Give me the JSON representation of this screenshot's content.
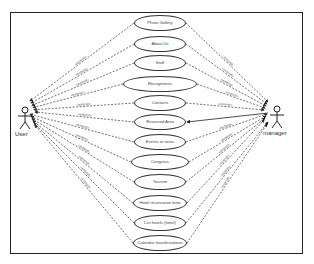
{
  "diagram": {
    "type": "use-case",
    "actors": [
      {
        "id": "user",
        "label": "User"
      },
      {
        "id": "manager",
        "label": "manager"
      }
    ],
    "use_cases": [
      {
        "label": "Photo Gallery",
        "cy": 23,
        "w": 52
      },
      {
        "label": "About Us",
        "cy": 44,
        "w": 52
      },
      {
        "label": "Staff",
        "cy": 63,
        "w": 52
      },
      {
        "label": "Recognitions",
        "cy": 84,
        "w": 74
      },
      {
        "label": "Contacts",
        "cy": 103,
        "w": 52
      },
      {
        "label": "Reserved Area",
        "cy": 122,
        "w": 52
      },
      {
        "label": "Events or news",
        "cy": 142,
        "w": 52
      },
      {
        "label": "Congress",
        "cy": 162,
        "w": 58
      },
      {
        "label": "Tourism",
        "cy": 182,
        "w": 52
      },
      {
        "label": "Hotel reservation form",
        "cy": 203,
        "w": 54
      },
      {
        "label": "List hotels (hotel)",
        "cy": 223,
        "w": 52
      },
      {
        "label": "Calendar manifestations",
        "cy": 243,
        "w": 54
      }
    ],
    "edge_label": "«extend»"
  }
}
